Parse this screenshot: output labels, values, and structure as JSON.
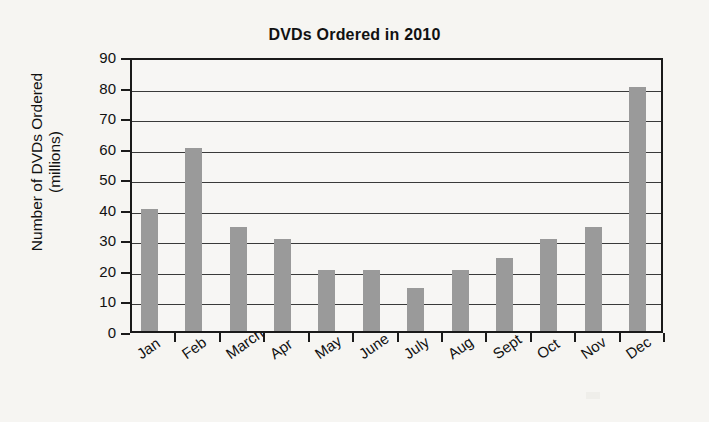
{
  "chart_data": {
    "type": "bar",
    "title": "DVDs Ordered in 2010",
    "xlabel": "",
    "ylabel": "Number of DVDs Ordered (millions)",
    "ylabel_lines": [
      "Number of DVDs Ordered",
      "(millions)"
    ],
    "categories": [
      "Jan",
      "Feb",
      "March",
      "Apr",
      "May",
      "June",
      "July",
      "Aug",
      "Sept",
      "Oct",
      "Nov",
      "Dec"
    ],
    "values": [
      40,
      60,
      34,
      30,
      20,
      20,
      14,
      20,
      24,
      30,
      34,
      80
    ],
    "ylim": [
      0,
      90
    ],
    "ytick_values": [
      0,
      10,
      20,
      30,
      40,
      50,
      60,
      70,
      80,
      90
    ],
    "ytick_labels": [
      "0",
      "10",
      "20",
      "30",
      "40",
      "50",
      "60",
      "70",
      "80",
      "90"
    ],
    "grid": true,
    "grid_axis": "y",
    "legend": false,
    "bar_color": "#9a9a9a",
    "axis_color": "#1a1a1a",
    "background_color": "#f6f5f2",
    "xtick_label_rotation": -35
  }
}
